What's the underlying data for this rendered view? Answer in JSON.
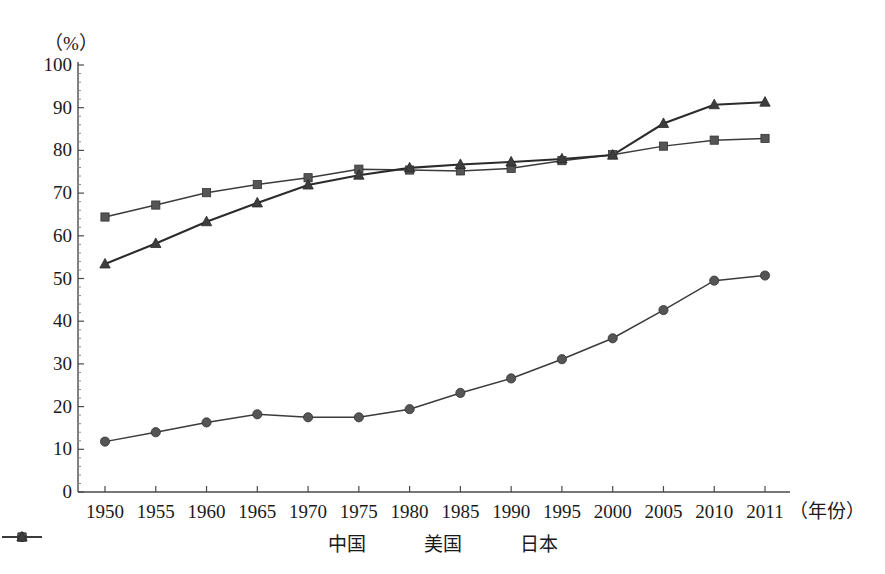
{
  "chart_data": {
    "type": "line",
    "title": "",
    "subtitle": "",
    "xlabel": "（年份）",
    "ylabel": "（%）",
    "y_unit_label": "（%）",
    "ylim": [
      0,
      100
    ],
    "ytick_step": 10,
    "grid": false,
    "legend_position": "bottom-center",
    "categories": [
      "1950",
      "1955",
      "1960",
      "1965",
      "1970",
      "1975",
      "1980",
      "1985",
      "1990",
      "1995",
      "2000",
      "2005",
      "2010",
      "2011"
    ],
    "x": [
      1950,
      1955,
      1960,
      1965,
      1970,
      1975,
      1980,
      1985,
      1990,
      1995,
      2000,
      2005,
      2010,
      2011
    ],
    "yticks": [
      0,
      10,
      20,
      30,
      40,
      50,
      60,
      70,
      80,
      90,
      100
    ],
    "ytick_labels": [
      "0",
      "10",
      "20",
      "30",
      "40",
      "50",
      "60",
      "70",
      "80",
      "90",
      "100"
    ],
    "series": [
      {
        "name": "中国",
        "marker": "circle",
        "color": "#555555",
        "values": [
          11.8,
          14.0,
          16.3,
          18.2,
          17.5,
          17.5,
          19.4,
          23.2,
          26.6,
          31.1,
          36.0,
          42.6,
          49.5,
          50.7
        ]
      },
      {
        "name": "美国",
        "marker": "square",
        "color": "#5a5a5a",
        "values": [
          64.4,
          67.2,
          70.1,
          72.0,
          73.6,
          75.6,
          75.4,
          75.2,
          75.8,
          77.6,
          79.0,
          81.0,
          82.4,
          82.8
        ]
      },
      {
        "name": "日本",
        "marker": "triangle",
        "color": "#3d3d3d",
        "values": [
          53.4,
          58.2,
          63.3,
          67.7,
          71.9,
          74.2,
          75.9,
          76.7,
          77.3,
          78.0,
          78.9,
          86.3,
          90.7,
          91.3
        ]
      }
    ]
  },
  "legend": {
    "items": [
      {
        "label": "中国",
        "marker": "circle"
      },
      {
        "label": "美国",
        "marker": "square"
      },
      {
        "label": "日本",
        "marker": "triangle"
      }
    ]
  },
  "axes": {
    "y_unit": "（%）",
    "x_axis_name": "（年份）"
  }
}
